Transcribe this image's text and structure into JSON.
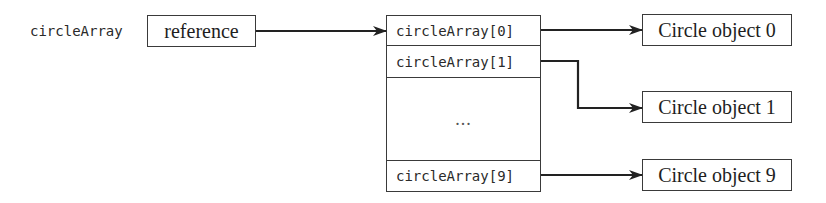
{
  "diagram": {
    "variable": {
      "name": "circleArray",
      "box_label": "reference"
    },
    "array": {
      "cells": [
        {
          "label": "circleArray[0]"
        },
        {
          "label": "circleArray[1]"
        },
        {
          "label": "..."
        },
        {
          "label": "circleArray[9]"
        }
      ]
    },
    "objects": [
      {
        "label": "Circle object 0"
      },
      {
        "label": "Circle object 1"
      },
      {
        "label": "Circle object 9"
      }
    ],
    "colors": {
      "stroke": "#3a3a3a",
      "arrow": "#222222",
      "background": "#ffffff"
    }
  }
}
